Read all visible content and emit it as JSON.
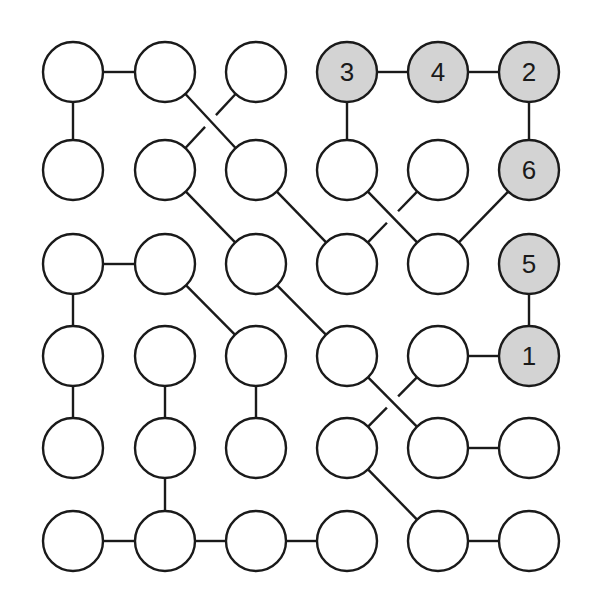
{
  "puzzle": {
    "rows": 6,
    "cols": 6,
    "col_x": [
      73,
      165,
      256,
      347,
      438,
      529
    ],
    "row_y": [
      72,
      170,
      264,
      356,
      448,
      541
    ],
    "radius": 30,
    "colors": {
      "empty_fill": "#ffffff",
      "given_fill": "#d3d3d3",
      "stroke": "#1a1a1a",
      "line": "#1a1a1a"
    },
    "nodes": [
      {
        "r": 0,
        "c": 0,
        "label": ""
      },
      {
        "r": 0,
        "c": 1,
        "label": ""
      },
      {
        "r": 0,
        "c": 2,
        "label": ""
      },
      {
        "r": 0,
        "c": 3,
        "label": "3"
      },
      {
        "r": 0,
        "c": 4,
        "label": "4"
      },
      {
        "r": 0,
        "c": 5,
        "label": "2"
      },
      {
        "r": 1,
        "c": 0,
        "label": ""
      },
      {
        "r": 1,
        "c": 1,
        "label": ""
      },
      {
        "r": 1,
        "c": 2,
        "label": ""
      },
      {
        "r": 1,
        "c": 3,
        "label": ""
      },
      {
        "r": 1,
        "c": 4,
        "label": ""
      },
      {
        "r": 1,
        "c": 5,
        "label": "6"
      },
      {
        "r": 2,
        "c": 0,
        "label": ""
      },
      {
        "r": 2,
        "c": 1,
        "label": ""
      },
      {
        "r": 2,
        "c": 2,
        "label": ""
      },
      {
        "r": 2,
        "c": 3,
        "label": ""
      },
      {
        "r": 2,
        "c": 4,
        "label": ""
      },
      {
        "r": 2,
        "c": 5,
        "label": "5"
      },
      {
        "r": 3,
        "c": 0,
        "label": ""
      },
      {
        "r": 3,
        "c": 1,
        "label": ""
      },
      {
        "r": 3,
        "c": 2,
        "label": ""
      },
      {
        "r": 3,
        "c": 3,
        "label": ""
      },
      {
        "r": 3,
        "c": 4,
        "label": ""
      },
      {
        "r": 3,
        "c": 5,
        "label": "1"
      },
      {
        "r": 4,
        "c": 0,
        "label": ""
      },
      {
        "r": 4,
        "c": 1,
        "label": ""
      },
      {
        "r": 4,
        "c": 2,
        "label": ""
      },
      {
        "r": 4,
        "c": 3,
        "label": ""
      },
      {
        "r": 4,
        "c": 4,
        "label": ""
      },
      {
        "r": 4,
        "c": 5,
        "label": ""
      },
      {
        "r": 5,
        "c": 0,
        "label": ""
      },
      {
        "r": 5,
        "c": 1,
        "label": ""
      },
      {
        "r": 5,
        "c": 2,
        "label": ""
      },
      {
        "r": 5,
        "c": 3,
        "label": ""
      },
      {
        "r": 5,
        "c": 4,
        "label": ""
      },
      {
        "r": 5,
        "c": 5,
        "label": ""
      }
    ],
    "edges": [
      [
        [
          0,
          0
        ],
        [
          0,
          1
        ]
      ],
      [
        [
          0,
          0
        ],
        [
          1,
          0
        ]
      ],
      [
        [
          0,
          1
        ],
        [
          1,
          2
        ]
      ],
      [
        [
          0,
          2
        ],
        [
          1,
          1
        ]
      ],
      [
        [
          0,
          3
        ],
        [
          0,
          4
        ]
      ],
      [
        [
          0,
          4
        ],
        [
          0,
          5
        ]
      ],
      [
        [
          0,
          3
        ],
        [
          1,
          3
        ]
      ],
      [
        [
          0,
          5
        ],
        [
          1,
          5
        ]
      ],
      [
        [
          1,
          1
        ],
        [
          2,
          2
        ]
      ],
      [
        [
          1,
          2
        ],
        [
          2,
          3
        ]
      ],
      [
        [
          1,
          3
        ],
        [
          2,
          4
        ]
      ],
      [
        [
          1,
          4
        ],
        [
          2,
          3
        ]
      ],
      [
        [
          1,
          5
        ],
        [
          2,
          4
        ]
      ],
      [
        [
          2,
          0
        ],
        [
          2,
          1
        ]
      ],
      [
        [
          2,
          0
        ],
        [
          3,
          0
        ]
      ],
      [
        [
          2,
          1
        ],
        [
          3,
          2
        ]
      ],
      [
        [
          2,
          2
        ],
        [
          3,
          3
        ]
      ],
      [
        [
          2,
          5
        ],
        [
          3,
          5
        ]
      ],
      [
        [
          3,
          0
        ],
        [
          4,
          0
        ]
      ],
      [
        [
          3,
          1
        ],
        [
          4,
          1
        ]
      ],
      [
        [
          3,
          2
        ],
        [
          4,
          2
        ]
      ],
      [
        [
          3,
          3
        ],
        [
          4,
          4
        ]
      ],
      [
        [
          3,
          4
        ],
        [
          3,
          5
        ]
      ],
      [
        [
          3,
          4
        ],
        [
          4,
          3
        ]
      ],
      [
        [
          4,
          1
        ],
        [
          5,
          1
        ]
      ],
      [
        [
          4,
          3
        ],
        [
          5,
          4
        ]
      ],
      [
        [
          4,
          4
        ],
        [
          4,
          5
        ]
      ],
      [
        [
          5,
          0
        ],
        [
          5,
          1
        ]
      ],
      [
        [
          5,
          1
        ],
        [
          5,
          2
        ]
      ],
      [
        [
          5,
          2
        ],
        [
          5,
          3
        ]
      ],
      [
        [
          5,
          4
        ],
        [
          5,
          5
        ]
      ]
    ],
    "broken_edges": [
      [
        [
          0,
          2
        ],
        [
          1,
          1
        ]
      ],
      [
        [
          1,
          4
        ],
        [
          2,
          3
        ]
      ],
      [
        [
          3,
          4
        ],
        [
          4,
          3
        ]
      ]
    ]
  }
}
